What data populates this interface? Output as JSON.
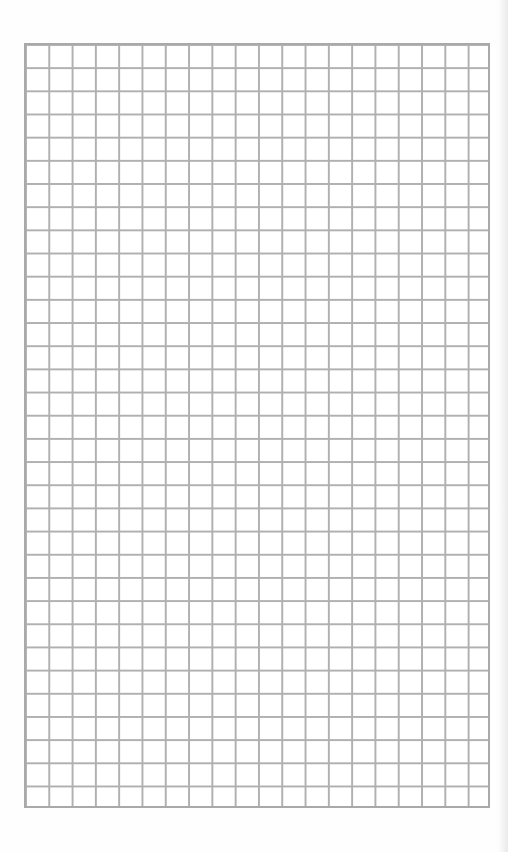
{
  "sheet": {
    "type": "graph-paper",
    "columns": 20,
    "rows": 33,
    "line_color": "#b0b0b0",
    "border_color": "#a9a9a9",
    "background_color": "#ffffff"
  }
}
